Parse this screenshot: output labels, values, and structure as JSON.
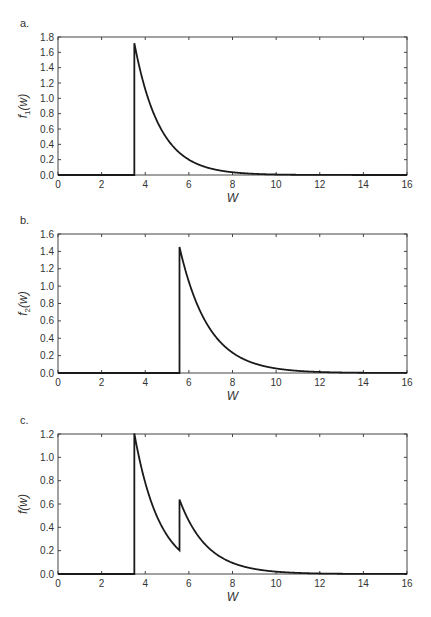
{
  "chart_data": [
    {
      "type": "line",
      "panel": "a.",
      "title": "",
      "xlabel": "W",
      "ylabel": "f1(w)",
      "ylabel_main": "f",
      "ylabel_sub": "1",
      "ylabel_tail": "(w)",
      "xlim": [
        0,
        16
      ],
      "ylim": [
        0,
        1.8
      ],
      "xticks": [
        0,
        2,
        4,
        6,
        8,
        10,
        12,
        14,
        16
      ],
      "yticks": [
        "0.0",
        "0.2",
        "0.4",
        "0.6",
        "0.8",
        "1.0",
        "1.2",
        "1.4",
        "1.6",
        "1.8"
      ],
      "grid": false,
      "legend": null,
      "model": {
        "onset": 3.5,
        "components": [
          {
            "weight": 1.0,
            "onset": 3.5,
            "peak": 1.72,
            "rate": 0.86
          }
        ]
      },
      "series": [
        {
          "name": "f1(w)",
          "x": [
            0,
            3.5,
            3.5,
            4,
            5,
            6,
            7,
            8,
            9,
            10,
            12,
            16
          ],
          "y": [
            0,
            0,
            1.72,
            1.12,
            0.47,
            0.2,
            0.08,
            0.036,
            0.015,
            0.006,
            0.001,
            0
          ]
        }
      ]
    },
    {
      "type": "line",
      "panel": "b.",
      "title": "",
      "xlabel": "W",
      "ylabel": "f2(w)",
      "ylabel_main": "f",
      "ylabel_sub": "2",
      "ylabel_tail": "(w)",
      "xlim": [
        0,
        16
      ],
      "ylim": [
        0,
        1.6
      ],
      "xticks": [
        0,
        2,
        4,
        6,
        8,
        10,
        12,
        14,
        16
      ],
      "yticks": [
        "0.0",
        "0.2",
        "0.4",
        "0.6",
        "0.8",
        "1.0",
        "1.2",
        "1.4",
        "1.6"
      ],
      "grid": false,
      "legend": null,
      "model": {
        "onset": 5.57,
        "components": [
          {
            "weight": 1.0,
            "onset": 5.57,
            "peak": 1.45,
            "rate": 0.75
          }
        ]
      },
      "series": [
        {
          "name": "f2(w)",
          "x": [
            0,
            5.57,
            5.57,
            6,
            7,
            8,
            9,
            10,
            12,
            16
          ],
          "y": [
            0,
            0,
            1.45,
            1.05,
            0.5,
            0.24,
            0.11,
            0.05,
            0.012,
            0
          ]
        }
      ]
    },
    {
      "type": "line",
      "panel": "c.",
      "title": "",
      "xlabel": "W",
      "ylabel": "f(w)",
      "ylabel_main": "f",
      "ylabel_sub": "",
      "ylabel_tail": "(w)",
      "xlim": [
        0,
        16
      ],
      "ylim": [
        0,
        1.2
      ],
      "xticks": [
        0,
        2,
        4,
        6,
        8,
        10,
        12,
        14,
        16
      ],
      "yticks": [
        "0.0",
        "0.2",
        "0.4",
        "0.6",
        "0.8",
        "1.0",
        "1.2"
      ],
      "grid": false,
      "legend": null,
      "model": {
        "onset": 3.5,
        "components": [
          {
            "weight": 0.7,
            "onset": 3.5,
            "peak": 1.72,
            "rate": 0.86
          },
          {
            "weight": 0.3,
            "onset": 5.57,
            "peak": 1.45,
            "rate": 0.75
          }
        ]
      },
      "series": [
        {
          "name": "f(w)",
          "x": [
            0,
            3.5,
            3.5,
            4,
            5,
            5.57,
            5.57,
            6,
            7,
            8,
            10,
            12,
            16
          ],
          "y": [
            0,
            0,
            1.2,
            0.78,
            0.33,
            0.2,
            0.63,
            0.45,
            0.21,
            0.1,
            0.02,
            0.004,
            0
          ]
        }
      ]
    }
  ],
  "layout": {
    "plot_left": 58,
    "plot_right": 407,
    "panels": [
      {
        "top": 37,
        "bottom": 175
      },
      {
        "top": 234,
        "bottom": 373
      },
      {
        "top": 434,
        "bottom": 574
      }
    ],
    "line_color": "#1a1a1a",
    "axis_color": "#444444"
  }
}
